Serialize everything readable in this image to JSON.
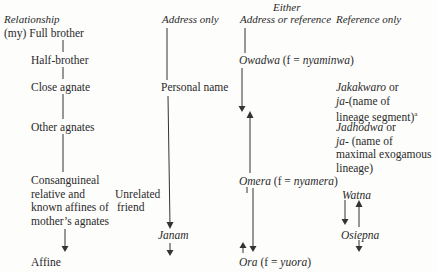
{
  "headers": {
    "relationship": "Relationship",
    "address_only": "Address only",
    "either": "Either",
    "address_or_reference": "Address or reference",
    "reference_only": "Reference only"
  },
  "relationship_column": {
    "full_brother": "(my) Full brother",
    "half_brother": "Half-brother",
    "close_agnate": "Close agnate",
    "other_agnates": "Other agnates",
    "consanguineal": [
      "Consanguineal",
      "relative and",
      "known affines of",
      "mother’s agnates"
    ],
    "affine": "Affine"
  },
  "address_only_column": {
    "personal_name": "Personal name",
    "unrelated_friend": [
      "Unrelated",
      "friend"
    ],
    "janam": "Janam"
  },
  "address_or_reference_column": {
    "owadwa": "Owadwa",
    "owadwa_f": "(f = ",
    "owadwa_f_term": "nyaminwa",
    "omera": "Omera",
    "omera_f": "(f = ",
    "omera_f_term": "nyamera",
    "ora": "Ora",
    "ora_f": "(f = ",
    "ora_f_term": "yuora",
    "close_paren": ")"
  },
  "reference_only_column": {
    "jakakwaro": "Jakakwaro",
    "or_1": " or",
    "ja_1": "ja-",
    "ja_1_rest": "(name of",
    "lineage_segment": "lineage segment)",
    "footnote_mark": "a",
    "jadhodwa": "Jadhodwa",
    "or_2": " or",
    "ja_2": "ja-",
    "ja_2_rest": " (name of",
    "maximal": "maximal exogamous",
    "lineage": "lineage)",
    "watna": "Watna",
    "osiepna": "Osiepna"
  }
}
